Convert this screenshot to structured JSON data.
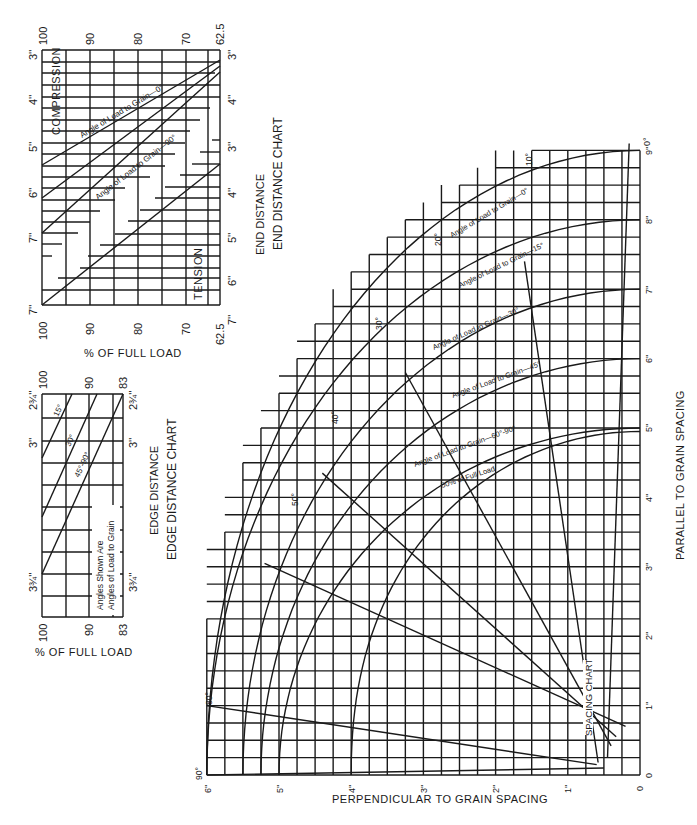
{
  "chart_data": [
    {
      "id": "end_distance_chart",
      "type": "line",
      "title": "END DISTANCE CHART",
      "subtitle": "END DISTANCE",
      "xlabel": "% OF FULL LOAD",
      "ylabel": "End distance (inches)",
      "x_ticks": [
        "100",
        "90",
        "80",
        "70",
        "62.5"
      ],
      "compression": {
        "label": "COMPRESSION",
        "y_ticks": [
          "3''",
          "4''",
          "5''",
          "6''",
          "7''"
        ],
        "series": [
          {
            "name": "Angle of Load to Grain—0°",
            "points": [
              [
                100,
                5.5
              ],
              [
                62.5,
                3.25
              ]
            ]
          },
          {
            "name": "Angle of Load to Grain—90°",
            "points": [
              [
                100,
                7.0
              ],
              [
                62.5,
                3.4
              ]
            ]
          },
          {
            "name": "intermediate",
            "points": [
              [
                100,
                6.25
              ],
              [
                62.5,
                3.3
              ]
            ]
          }
        ]
      },
      "tension": {
        "label": "TENSION",
        "y_ticks_left": [
          "7''"
        ],
        "y_ticks_right": [
          "3''",
          "4''",
          "5''",
          "6''",
          "7''"
        ],
        "series": [
          {
            "name": "Tension",
            "points": [
              [
                100,
                7.0
              ],
              [
                62.5,
                3.5
              ]
            ]
          }
        ]
      },
      "grid": true
    },
    {
      "id": "edge_distance_chart",
      "type": "line",
      "title": "EDGE DISTANCE CHART",
      "subtitle": "EDGE DISTANCE",
      "xlabel": "% OF FULL LOAD",
      "x_ticks": [
        "100",
        "90",
        "83"
      ],
      "y_ticks": [
        "2¾''",
        "3''",
        "3¾''"
      ],
      "note": [
        "Angles Shown Are",
        "Angles of Load to Grain"
      ],
      "series": [
        {
          "name": "15°",
          "points": [
            [
              100,
              3.0
            ],
            [
              87,
              2.75
            ]
          ]
        },
        {
          "name": "30°",
          "points": [
            [
              100,
              3.35
            ],
            [
              83,
              2.75
            ]
          ]
        },
        {
          "name": "45°-90°",
          "points": [
            [
              100,
              3.75
            ],
            [
              83,
              2.75
            ]
          ]
        }
      ],
      "grid": true
    },
    {
      "id": "spacing_chart",
      "type": "line",
      "title": "SPACING CHART",
      "xlabel": "PERPENDICULAR TO GRAIN SPACING",
      "ylabel": "PARALLEL TO GRAIN SPACING",
      "x_ticks": [
        "6''",
        "5''",
        "4''",
        "3''",
        "2''",
        "1''",
        "0"
      ],
      "y_ticks": [
        "0",
        "1''",
        "2''",
        "3''",
        "4''",
        "5''",
        "6''",
        "7''",
        "8''",
        "9''"
      ],
      "xlim": [
        6,
        0
      ],
      "ylim": [
        0,
        9
      ],
      "angle_labels": [
        "0°",
        "10°",
        "20°",
        "30°",
        "40°",
        "50°",
        "80°",
        "90°"
      ],
      "series": [
        {
          "name": "Angle of Load to Grain—0°",
          "end_parallel": 9
        },
        {
          "name": "Angle of Load to Grain—15°",
          "end_parallel": 8
        },
        {
          "name": "Angle of Load to Grain—30°",
          "end_parallel": 7
        },
        {
          "name": "Angle of Load to Grain—45°",
          "end_parallel": 6
        },
        {
          "name": "Angle of Load to Grain—60°-90°",
          "end_parallel": 5
        },
        {
          "name": "50% of Full Load",
          "end_parallel": 5
        }
      ],
      "grid": true
    }
  ],
  "labels": {
    "end": {
      "pct_100": "100",
      "pct_90": "90",
      "pct_80": "80",
      "pct_70": "70",
      "pct_625": "62.5",
      "in3": "3''",
      "in4": "4''",
      "in5": "5''",
      "in6": "6''",
      "in7": "7''",
      "compression": "COMPRESSION",
      "tension": "TENSION",
      "curve0": "Angle of Load to Grain—0°",
      "curve90": "Angle of Load to Grain—90°",
      "xlabel": "% OF FULL LOAD",
      "subtitle": "END DISTANCE",
      "title": "END DISTANCE CHART"
    },
    "edge": {
      "pct_100": "100",
      "pct_90": "90",
      "pct_83": "83",
      "in275": "2¾''",
      "in3": "3''",
      "in375": "3¾''",
      "a15": "15°",
      "a30": "30°",
      "a4590": "45°-90°",
      "note1": "Angles Shown Are",
      "note2": "Angles of Load to Grain",
      "xlabel": "% OF FULL LOAD",
      "subtitle": "EDGE DISTANCE",
      "title": "EDGE DISTANCE CHART"
    },
    "spacing": {
      "title": "SPACING CHART",
      "xlabel": "PERPENDICULAR TO GRAIN SPACING",
      "ylabel": "PARALLEL TO GRAIN SPACING",
      "p0": "0",
      "p1": "1''",
      "p2": "2''",
      "p3": "3''",
      "p4": "4''",
      "p5": "5''",
      "p6": "6''",
      "p7": "7''",
      "p8": "8''",
      "p9": "9''",
      "q0": "0",
      "q1": "1''",
      "q2": "2''",
      "q3": "3''",
      "q4": "4''",
      "q5": "5''",
      "q6": "6''",
      "a0": "0°",
      "a10": "10°",
      "a20": "20°",
      "a30": "30°",
      "a40": "40°",
      "a50": "50°",
      "a80": "80°",
      "a90": "90°",
      "c0": "Angle of Load to Grain—0°",
      "c15": "Angle of Load to Grain—15°",
      "c30": "Angle of Load to Grain—30°",
      "c45": "Angle of Load to Grain—45°",
      "c6090": "Angle of Load to Grain—60°-90°",
      "c50": "50% of Full Load"
    }
  }
}
